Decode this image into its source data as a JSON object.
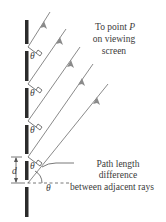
{
  "diagram": {
    "labels": {
      "to_point": [
        "To point P",
        "on viewing",
        "screen"
      ],
      "to_point_line1_prefix": "To point ",
      "to_point_symbol": "P",
      "path_diff": [
        "Path length",
        "difference",
        "between adjacent rays"
      ],
      "theta": "θ",
      "spacing": "d"
    },
    "colors": {
      "wall": "#2b2b2b",
      "ray": "#8a8a8a",
      "arrow": "#8a8a8a",
      "text": "#3a3a3a"
    },
    "slits_y": [
      47,
      84,
      121,
      157,
      183
    ],
    "ray_count": 5
  }
}
